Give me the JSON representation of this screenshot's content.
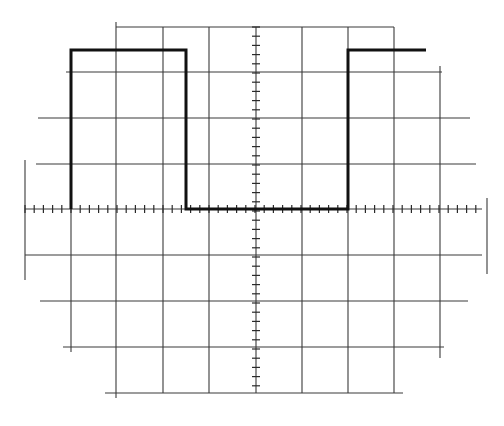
{
  "figure": {
    "title": ""
  },
  "graticule": {
    "vertical_lines": [
      {
        "x": 25,
        "y1": 160,
        "y2": 280,
        "role": "left-edge"
      },
      {
        "x": 71,
        "y1": 50,
        "y2": 352
      },
      {
        "x": 116,
        "y1": 22,
        "y2": 398
      },
      {
        "x": 163,
        "y1": 27,
        "y2": 393
      },
      {
        "x": 209,
        "y1": 27,
        "y2": 393
      },
      {
        "x": 302,
        "y1": 27,
        "y2": 393
      },
      {
        "x": 348,
        "y1": 27,
        "y2": 393
      },
      {
        "x": 394,
        "y1": 27,
        "y2": 393
      },
      {
        "x": 440,
        "y1": 66,
        "y2": 358
      },
      {
        "x": 487,
        "y1": 198,
        "y2": 274,
        "role": "right-edge"
      }
    ],
    "horizontal_lines": [
      {
        "y": 27,
        "x1": 116,
        "x2": 394
      },
      {
        "y": 72,
        "x1": 66,
        "x2": 442
      },
      {
        "y": 118,
        "x1": 38,
        "x2": 470
      },
      {
        "y": 164,
        "x1": 36,
        "x2": 476
      },
      {
        "y": 255,
        "x1": 25,
        "x2": 482
      },
      {
        "y": 301,
        "x1": 40,
        "x2": 468
      },
      {
        "y": 347,
        "x1": 63,
        "x2": 444
      },
      {
        "y": 393,
        "x1": 105,
        "x2": 403
      }
    ],
    "center_axis": {
      "horizontal": {
        "y": 209,
        "x1": 25,
        "x2": 482
      },
      "vertical": {
        "x": 256,
        "y1": 27,
        "y2": 393
      },
      "minor_divisions_per_major": 5
    },
    "major_division_px": 46,
    "major_x": [
      25,
      71,
      116,
      163,
      209,
      256,
      302,
      348,
      394,
      440,
      487
    ],
    "major_y": [
      27,
      72,
      118,
      164,
      209,
      255,
      301,
      347,
      393
    ]
  },
  "trace": {
    "name": "square-wave",
    "color": "#111111",
    "points": [
      [
        71,
        209
      ],
      [
        71,
        50
      ],
      [
        186,
        50
      ],
      [
        186,
        209
      ],
      [
        348,
        209
      ],
      [
        348,
        50
      ],
      [
        426,
        50
      ]
    ]
  }
}
